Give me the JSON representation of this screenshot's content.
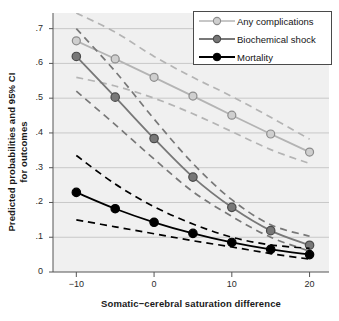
{
  "chart_data": {
    "type": "line",
    "title": "",
    "xlabel": "Somatic−cerebral saturation difference",
    "ylabel": "Predicted probabilities and 95% CI for outcomes",
    "ylabel_lines": [
      "Predicted probabilities and 95% CI",
      "for outcomes"
    ],
    "x": [
      -10,
      -5,
      0,
      5,
      10,
      15,
      20
    ],
    "xlim": [
      -13,
      22.5
    ],
    "ylim": [
      0,
      0.745
    ],
    "xticks": [
      -10,
      0,
      10,
      20
    ],
    "xticklabels": [
      "−10",
      "0",
      "10",
      "20"
    ],
    "yticks": [
      0,
      0.1,
      0.2,
      0.3,
      0.4,
      0.5,
      0.6,
      0.7
    ],
    "yticklabels": [
      "0",
      ".1",
      ".2",
      ".3",
      ".4",
      ".5",
      ".6",
      ".7"
    ],
    "grid": "horizontal",
    "legend_position": "top-right",
    "plot_background": "#f0f0f0",
    "grid_color": "#c8c8c8",
    "series": [
      {
        "name": "Any complications",
        "color": "#b4b4b4",
        "marker": "circle-open",
        "values": [
          0.665,
          0.613,
          0.56,
          0.506,
          0.451,
          0.397,
          0.345
        ],
        "ci_upper": [
          0.745,
          0.69,
          0.62,
          0.56,
          0.505,
          0.445,
          0.382
        ],
        "ci_lower": [
          0.56,
          0.535,
          0.5,
          0.455,
          0.404,
          0.352,
          0.312
        ]
      },
      {
        "name": "Biochemical shock",
        "color": "#787878",
        "marker": "circle-filled",
        "values": [
          0.62,
          0.503,
          0.384,
          0.273,
          0.186,
          0.119,
          0.077
        ],
        "ci_upper": [
          0.7,
          0.577,
          0.44,
          0.312,
          0.208,
          0.136,
          0.103
        ],
        "ci_lower": [
          0.52,
          0.424,
          0.325,
          0.231,
          0.16,
          0.1,
          0.06
        ]
      },
      {
        "name": "Mortality",
        "color": "#000000",
        "marker": "circle-filled",
        "values": [
          0.229,
          0.182,
          0.143,
          0.111,
          0.085,
          0.065,
          0.05
        ],
        "ci_upper": [
          0.335,
          0.253,
          0.188,
          0.138,
          0.1,
          0.078,
          0.068
        ],
        "ci_lower": [
          0.15,
          0.13,
          0.11,
          0.09,
          0.072,
          0.053,
          0.037
        ]
      }
    ]
  },
  "legend": {
    "items": [
      {
        "label": "Any complications"
      },
      {
        "label": "Biochemical shock"
      },
      {
        "label": "Mortality"
      }
    ]
  }
}
